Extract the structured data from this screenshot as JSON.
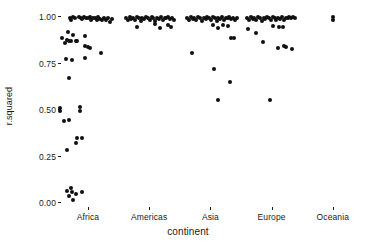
{
  "chart_data": {
    "type": "scatter",
    "title": "",
    "xlabel": "continent",
    "ylabel": "r.squared",
    "categories": [
      "Africa",
      "Americas",
      "Asia",
      "Europe",
      "Oceania"
    ],
    "x_tick_labels": [
      "Africa",
      "Americas",
      "Asia",
      "Europe",
      "Oceania"
    ],
    "y_tick_labels": [
      "0.00",
      "0.25",
      "0.50",
      "0.75",
      "1.00"
    ],
    "y_tick_values": [
      0.0,
      0.25,
      0.5,
      0.75,
      1.0
    ],
    "ylim": [
      -0.03,
      1.04
    ],
    "grid": false,
    "legend": "none",
    "point_color": "#101010",
    "point_size_px": 4,
    "jitter": true,
    "series": [
      {
        "name": "Africa",
        "points": [
          [
            -0.42,
            0.885
          ],
          [
            -0.38,
            0.86
          ],
          [
            -0.3,
            0.995
          ],
          [
            -0.27,
            0.985
          ],
          [
            -0.25,
            1.0
          ],
          [
            -0.22,
            0.995
          ],
          [
            -0.33,
            0.92
          ],
          [
            -0.35,
            0.875
          ],
          [
            -0.31,
            0.872
          ],
          [
            -0.28,
            0.87
          ],
          [
            -0.24,
            0.905
          ],
          [
            -0.2,
            0.872
          ],
          [
            -0.18,
            0.87
          ],
          [
            -0.15,
            0.998
          ],
          [
            -0.12,
            0.992
          ],
          [
            -0.09,
            0.988
          ],
          [
            -0.06,
            1.0
          ],
          [
            -0.03,
            0.996
          ],
          [
            0.0,
            0.994
          ],
          [
            0.03,
            0.998
          ],
          [
            0.05,
            0.985
          ],
          [
            0.08,
            0.992
          ],
          [
            0.11,
            0.996
          ],
          [
            0.14,
            0.984
          ],
          [
            0.17,
            0.998
          ],
          [
            0.2,
            0.99
          ],
          [
            0.23,
            0.986
          ],
          [
            0.26,
            0.996
          ],
          [
            0.3,
            0.982
          ],
          [
            0.33,
            0.995
          ],
          [
            0.36,
            0.975
          ],
          [
            0.4,
            0.99
          ],
          [
            -0.36,
            0.773
          ],
          [
            -0.26,
            0.768
          ],
          [
            -0.05,
            0.9
          ],
          [
            -0.05,
            0.843
          ],
          [
            0.0,
            0.838
          ],
          [
            0.03,
            0.836
          ],
          [
            -0.05,
            0.778
          ],
          [
            0.22,
            0.808
          ],
          [
            -0.31,
            0.672
          ],
          [
            -0.45,
            0.51
          ],
          [
            -0.45,
            0.495
          ],
          [
            -0.4,
            0.44
          ],
          [
            -0.31,
            0.447
          ],
          [
            -0.13,
            0.515
          ],
          [
            -0.13,
            0.493
          ],
          [
            -0.19,
            0.323
          ],
          [
            -0.18,
            0.35
          ],
          [
            -0.09,
            0.352
          ],
          [
            -0.35,
            0.283
          ],
          [
            -0.35,
            0.063
          ],
          [
            -0.28,
            0.082
          ],
          [
            -0.26,
            0.06
          ],
          [
            -0.31,
            0.035
          ],
          [
            -0.25,
            0.018
          ],
          [
            -0.2,
            0.047
          ],
          [
            -0.09,
            0.06
          ]
        ]
      },
      {
        "name": "Americas",
        "points": [
          [
            0.62,
            0.996
          ],
          [
            0.65,
            0.985
          ],
          [
            0.68,
            0.998
          ],
          [
            0.71,
            0.99
          ],
          [
            0.74,
            0.996
          ],
          [
            0.77,
            0.984
          ],
          [
            0.8,
            0.998
          ],
          [
            0.83,
            0.992
          ],
          [
            0.86,
            0.98
          ],
          [
            0.89,
            0.996
          ],
          [
            0.92,
            0.988
          ],
          [
            0.95,
            0.998
          ],
          [
            0.98,
            0.994
          ],
          [
            1.01,
            0.986
          ],
          [
            1.04,
            0.998
          ],
          [
            1.07,
            0.992
          ],
          [
            1.1,
            0.98
          ],
          [
            1.13,
            0.996
          ],
          [
            1.16,
            0.99
          ],
          [
            1.19,
            0.998
          ],
          [
            1.22,
            0.985
          ],
          [
            1.25,
            0.995
          ],
          [
            1.28,
            0.992
          ],
          [
            1.31,
            0.998
          ],
          [
            1.34,
            0.988
          ],
          [
            1.37,
            0.996
          ],
          [
            1.4,
            0.983
          ],
          [
            0.8,
            0.945
          ],
          [
            1.1,
            0.96
          ],
          [
            1.18,
            0.942
          ],
          [
            1.3,
            0.958
          ],
          [
            1.35,
            0.947
          ]
        ]
      },
      {
        "name": "Asia",
        "points": [
          [
            1.62,
            0.996
          ],
          [
            1.65,
            0.985
          ],
          [
            1.68,
            0.998
          ],
          [
            1.71,
            0.99
          ],
          [
            1.74,
            0.996
          ],
          [
            1.77,
            0.982
          ],
          [
            1.8,
            0.998
          ],
          [
            1.83,
            0.992
          ],
          [
            1.86,
            0.978
          ],
          [
            1.89,
            0.996
          ],
          [
            1.92,
            0.988
          ],
          [
            1.95,
            0.998
          ],
          [
            1.98,
            0.994
          ],
          [
            2.01,
            0.986
          ],
          [
            2.04,
            0.998
          ],
          [
            2.07,
            0.992
          ],
          [
            2.1,
            0.98
          ],
          [
            2.13,
            0.996
          ],
          [
            2.16,
            0.99
          ],
          [
            2.19,
            0.998
          ],
          [
            2.22,
            0.985
          ],
          [
            2.25,
            0.995
          ],
          [
            2.28,
            0.992
          ],
          [
            2.31,
            0.998
          ],
          [
            2.34,
            0.988
          ],
          [
            2.37,
            0.996
          ],
          [
            2.4,
            0.983
          ],
          [
            2.43,
            0.994
          ],
          [
            1.7,
            0.808
          ],
          [
            2.05,
            0.955
          ],
          [
            2.12,
            0.94
          ],
          [
            2.2,
            0.958
          ],
          [
            2.28,
            0.95
          ],
          [
            2.33,
            0.888
          ],
          [
            2.38,
            0.885
          ],
          [
            2.06,
            0.722
          ],
          [
            2.32,
            0.652
          ],
          [
            2.12,
            0.552
          ]
        ]
      },
      {
        "name": "Europe",
        "points": [
          [
            2.6,
            0.996
          ],
          [
            2.63,
            0.985
          ],
          [
            2.66,
            0.998
          ],
          [
            2.69,
            0.99
          ],
          [
            2.72,
            0.996
          ],
          [
            2.75,
            0.984
          ],
          [
            2.78,
            0.998
          ],
          [
            2.81,
            0.992
          ],
          [
            2.84,
            0.98
          ],
          [
            2.87,
            0.996
          ],
          [
            2.9,
            0.988
          ],
          [
            2.93,
            0.998
          ],
          [
            2.96,
            0.994
          ],
          [
            2.99,
            0.986
          ],
          [
            3.02,
            0.998
          ],
          [
            3.05,
            0.992
          ],
          [
            3.08,
            0.982
          ],
          [
            3.11,
            0.996
          ],
          [
            3.14,
            0.99
          ],
          [
            3.17,
            0.998
          ],
          [
            3.2,
            0.986
          ],
          [
            3.23,
            0.996
          ],
          [
            3.26,
            0.992
          ],
          [
            3.29,
            0.998
          ],
          [
            3.32,
            0.994
          ],
          [
            3.35,
            0.998
          ],
          [
            3.38,
            0.996
          ],
          [
            2.62,
            0.938
          ],
          [
            2.74,
            0.915
          ],
          [
            3.02,
            0.952
          ],
          [
            3.12,
            0.948
          ],
          [
            3.18,
            0.945
          ],
          [
            2.86,
            0.868
          ],
          [
            3.1,
            0.833
          ],
          [
            3.2,
            0.845
          ],
          [
            3.23,
            0.838
          ],
          [
            3.34,
            0.83
          ],
          [
            2.98,
            0.555
          ]
        ]
      },
      {
        "name": "Oceania",
        "points": [
          [
            4.0,
            1.0
          ],
          [
            4.0,
            0.982
          ]
        ]
      }
    ]
  }
}
